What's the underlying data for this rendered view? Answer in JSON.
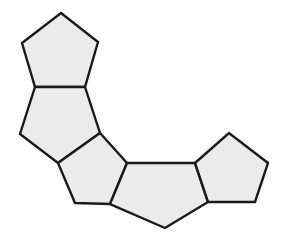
{
  "figure": {
    "kind": "geometric-diagram",
    "background_color": "#ffffff",
    "canvas": {
      "width": 285,
      "height": 240
    },
    "style": {
      "fill_color": "#ebebeb",
      "stroke_color": "#1a1a1a",
      "stroke_width": 2.4
    },
    "shape_count": 5,
    "shapes": [
      {
        "name": "pentagon-1",
        "label": "top-left pentagon",
        "orientation_deg": 0,
        "points": "61,13 98,42 85,87 35,87 22,43"
      },
      {
        "name": "pentagon-2",
        "label": "upper-left pentagon",
        "orientation_deg": 28,
        "points": "85,87 100,133 58,163 20,134 35,87"
      },
      {
        "name": "pentagon-3",
        "label": "lower-left pentagon",
        "orientation_deg": 72,
        "points": "100,133 127,163 110,204 75,203 58,163"
      },
      {
        "name": "pentagon-4",
        "label": "bottom-center pentagon",
        "orientation_deg": 180,
        "points": "127,163 195,163 208,202 165,228 110,204"
      },
      {
        "name": "pentagon-5",
        "label": "right pentagon",
        "orientation_deg": 160,
        "points": "195,163 229,133 268,163 255,202 208,202"
      }
    ]
  }
}
